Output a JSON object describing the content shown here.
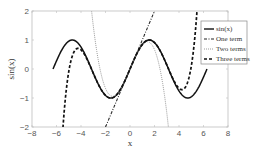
{
  "chart_data": {
    "type": "line",
    "title": "",
    "xlabel": "x",
    "ylabel": "sin(x)",
    "xlim": [
      -8,
      8
    ],
    "ylim": [
      -2,
      2
    ],
    "xticks": [
      -8,
      -6,
      -4,
      -2,
      0,
      2,
      4,
      6,
      8
    ],
    "yticks": [
      -2,
      -1,
      0,
      1,
      2
    ],
    "grid": false,
    "legend_position": "upper right",
    "series": [
      {
        "name": "sin(x)",
        "style": "solid",
        "color": "#111111",
        "function": "sin(x)",
        "x_range": [
          -6.283,
          6.283
        ]
      },
      {
        "name": "One term",
        "style": "dash-dot",
        "color": "#222222",
        "function": "x",
        "x_range": [
          -2,
          2
        ]
      },
      {
        "name": "Two terms",
        "style": "dotted",
        "color": "#9a9a9a",
        "function": "x - x^3/6",
        "x_range": [
          -3.2,
          3.2
        ]
      },
      {
        "name": "Three terms",
        "style": "dashed",
        "color": "#111111",
        "function": "x - x^3/6 + x^5/120 - x^7/5040 + x^9/362880",
        "x_range": [
          -5.6,
          5.6
        ]
      }
    ]
  },
  "axes": {
    "xlabel": "x",
    "ylabel": "sin(x)",
    "xtick_labels": [
      "−8",
      "−6",
      "−4",
      "−2",
      "0",
      "2",
      "4",
      "6",
      "8"
    ],
    "ytick_labels": [
      "−2",
      "−1",
      "0",
      "1",
      "2"
    ]
  },
  "legend": {
    "items": [
      {
        "label": "sin(x)"
      },
      {
        "label": "One term"
      },
      {
        "label": "Two terms"
      },
      {
        "label": "Three terms"
      }
    ]
  }
}
